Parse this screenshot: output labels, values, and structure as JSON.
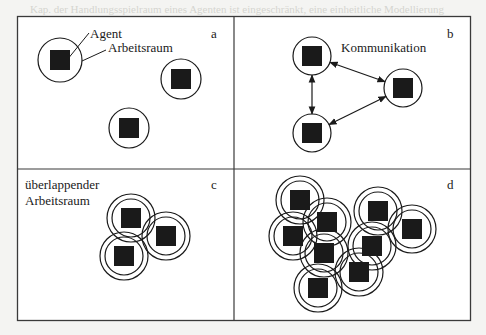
{
  "figure": {
    "panels": [
      {
        "id": "a",
        "letter": "a",
        "labels": {
          "agent": "Agent",
          "workspace": "Arbeitsraum"
        },
        "agents": [
          {
            "x": 60,
            "y": 60,
            "rings": [
              22
            ]
          },
          {
            "x": 181,
            "y": 79,
            "rings": [
              20
            ]
          },
          {
            "x": 129,
            "y": 128,
            "rings": [
              20
            ]
          }
        ]
      },
      {
        "id": "b",
        "letter": "b",
        "labels": {
          "communication": "Kommunikation"
        },
        "agents": [
          {
            "x": 312,
            "y": 56,
            "rings": [
              19
            ]
          },
          {
            "x": 403,
            "y": 88,
            "rings": [
              19
            ]
          },
          {
            "x": 312,
            "y": 133,
            "rings": [
              19
            ]
          }
        ],
        "links": [
          {
            "from": 0,
            "to": 1
          },
          {
            "from": 0,
            "to": 2
          },
          {
            "from": 2,
            "to": 1
          }
        ]
      },
      {
        "id": "c",
        "letter": "c",
        "labels": {
          "overlap_line1": "überlappender",
          "overlap_line2": "Arbeitsraum"
        },
        "agents": [
          {
            "x": 131,
            "y": 218,
            "rings": [
              19,
              24
            ]
          },
          {
            "x": 166,
            "y": 236,
            "rings": [
              19,
              24
            ]
          },
          {
            "x": 124,
            "y": 256,
            "rings": [
              19,
              24
            ]
          }
        ]
      },
      {
        "id": "d",
        "letter": "d",
        "agents": [
          {
            "x": 300,
            "y": 200,
            "rings": [
              19,
              24
            ]
          },
          {
            "x": 327,
            "y": 222,
            "rings": [
              19,
              24
            ]
          },
          {
            "x": 378,
            "y": 211,
            "rings": [
              19,
              24
            ]
          },
          {
            "x": 412,
            "y": 229,
            "rings": [
              19,
              24
            ]
          },
          {
            "x": 293,
            "y": 236,
            "rings": [
              19,
              24
            ]
          },
          {
            "x": 324,
            "y": 253,
            "rings": [
              19,
              24
            ]
          },
          {
            "x": 372,
            "y": 246,
            "rings": [
              19,
              24
            ]
          },
          {
            "x": 359,
            "y": 272,
            "rings": [
              19,
              24
            ]
          },
          {
            "x": 318,
            "y": 288,
            "rings": [
              19,
              24
            ]
          }
        ]
      }
    ],
    "colors": {
      "ink": "#1a1a1a",
      "frame": "#3a3a3a",
      "paper": "#f4f4f2",
      "fill": "#ffffff"
    }
  }
}
